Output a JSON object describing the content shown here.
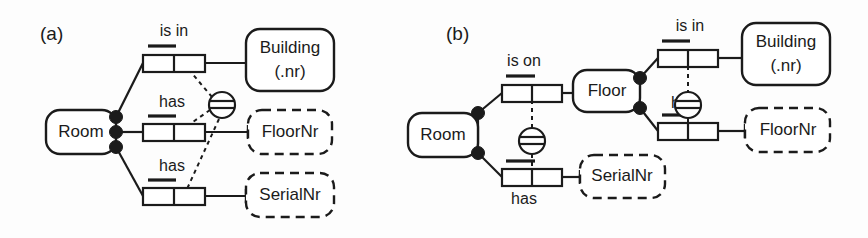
{
  "figure": {
    "type": "orm-diagram",
    "panels": [
      {
        "id": "a",
        "label": "(a)",
        "entities": [
          {
            "name": "Room",
            "kind": "entity-type",
            "border": "solid",
            "text": "Room"
          },
          {
            "name": "Building",
            "kind": "entity-type",
            "border": "solid",
            "text": "Building\n(.nr)",
            "line1": "Building",
            "line2": "(.nr)"
          },
          {
            "name": "FloorNr",
            "kind": "value-type",
            "border": "dashed",
            "text": "FloorNr"
          },
          {
            "name": "SerialNr",
            "kind": "value-type",
            "border": "dashed",
            "text": "SerialNr"
          }
        ],
        "predicates": [
          {
            "name": "is-in",
            "label": "is in",
            "from": "Room",
            "to": "Building"
          },
          {
            "name": "has-floornr",
            "label": "has",
            "from": "Room",
            "to": "FloorNr"
          },
          {
            "name": "has-serialnr",
            "label": "has",
            "from": "Room",
            "to": "SerialNr"
          }
        ],
        "constraints": [
          {
            "name": "external-uniqueness",
            "symbol": "circle-with-bar",
            "attached_to": [
              "is in",
              "has",
              "has"
            ]
          }
        ]
      },
      {
        "id": "b",
        "label": "(b)",
        "entities": [
          {
            "name": "Room",
            "kind": "entity-type",
            "border": "solid",
            "text": "Room"
          },
          {
            "name": "Floor",
            "kind": "entity-type",
            "border": "solid",
            "text": "Floor"
          },
          {
            "name": "Building",
            "kind": "entity-type",
            "border": "solid",
            "text": "Building\n(.nr)",
            "line1": "Building",
            "line2": "(.nr)"
          },
          {
            "name": "FloorNr",
            "kind": "value-type",
            "border": "dashed",
            "text": "FloorNr"
          },
          {
            "name": "SerialNr",
            "kind": "value-type",
            "border": "dashed",
            "text": "SerialNr"
          }
        ],
        "predicates": [
          {
            "name": "is-on",
            "label": "is on",
            "from": "Room",
            "to": "Floor"
          },
          {
            "name": "has-serialnr",
            "label": "has",
            "from": "Room",
            "to": "SerialNr"
          },
          {
            "name": "is-in",
            "label": "is in",
            "from": "Floor",
            "to": "Building"
          },
          {
            "name": "has-floornr",
            "label": "has",
            "from": "Floor",
            "to": "FloorNr"
          }
        ],
        "constraints": [
          {
            "name": "external-uniqueness-room",
            "symbol": "circle-with-bar",
            "attached_to": [
              "is on",
              "has"
            ]
          },
          {
            "name": "external-uniqueness-floor",
            "symbol": "circle-with-bar",
            "attached_to": [
              "is in",
              "has"
            ]
          }
        ]
      }
    ],
    "colors": {
      "ink": "#1b1b1b",
      "paper": "#fdfdfd",
      "fill": "#ffffff"
    }
  },
  "labels": {
    "panel_a": "(a)",
    "panel_b": "(b)",
    "room": "Room",
    "floor": "Floor",
    "building_line1": "Building",
    "building_line2": "(.nr)",
    "floornr": "FloorNr",
    "serialnr": "SerialNr",
    "is_in": "is in",
    "is_on": "is on",
    "has": "has"
  }
}
